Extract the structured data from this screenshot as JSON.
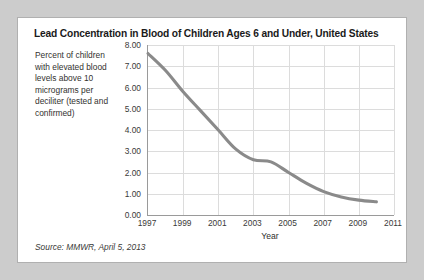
{
  "card": {
    "title": "Lead Concentration in Blood of Children Ages 6 and Under, United States",
    "y_axis_caption": "Percent of children with elevated blood levels above 10 micrograms per deciliter (tested and confirmed)",
    "source": "Source: MMWR, April 5, 2013"
  },
  "colors": {
    "page_background": "#cccccc",
    "card_background": "#ffffff",
    "card_border": "#b0b0b0",
    "grid": "#dcdcdc",
    "axis": "#9a9a9a",
    "series_line": "#8a8a8a",
    "title_text": "#1a1a1a",
    "body_text": "#3a3a38"
  },
  "chart_data": {
    "type": "line",
    "title": "Lead Concentration in Blood of Children Ages 6 and Under, United States",
    "xlabel": "Year",
    "ylabel": "Percent of children with elevated blood levels above 10 micrograms per deciliter (tested and confirmed)",
    "xlim": [
      1997,
      2011
    ],
    "ylim": [
      0.0,
      8.0
    ],
    "ytick_labels": [
      "8.00",
      "7.00",
      "6.00",
      "5.00",
      "4.00",
      "3.00",
      "2.00",
      "1.00",
      "0.00"
    ],
    "ytick_values": [
      8,
      7,
      6,
      5,
      4,
      3,
      2,
      1,
      0
    ],
    "xtick_labels": [
      "1997",
      "1999",
      "2001",
      "2003",
      "2005",
      "2007",
      "2009",
      "2011"
    ],
    "xtick_values": [
      1997,
      1999,
      2001,
      2003,
      2005,
      2007,
      2009,
      2011
    ],
    "grid": true,
    "legend": "none",
    "series": [
      {
        "name": "Percent of children with elevated blood lead levels",
        "x": [
          1997,
          1998,
          1999,
          2000,
          2001,
          2002,
          2003,
          2004,
          2005,
          2006,
          2007,
          2008,
          2009,
          2010
        ],
        "values": [
          7.6,
          6.8,
          5.8,
          4.9,
          4.0,
          3.1,
          2.6,
          2.5,
          2.0,
          1.5,
          1.1,
          0.85,
          0.7,
          0.62
        ]
      }
    ]
  }
}
